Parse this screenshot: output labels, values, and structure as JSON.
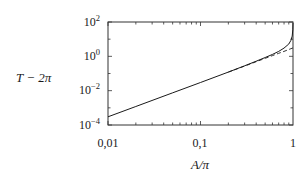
{
  "chart_data": {
    "type": "line",
    "title": "",
    "xlabel": "A/π",
    "ylabel": "T − 2π",
    "xscale": "log",
    "yscale": "log",
    "xlim": [
      0.01,
      1
    ],
    "ylim": [
      0.0001,
      100
    ],
    "x_ticks": [
      {
        "value": 0.01,
        "label": "0,01"
      },
      {
        "value": 0.1,
        "label": "0,1"
      },
      {
        "value": 1,
        "label": "1"
      }
    ],
    "y_ticks": [
      {
        "value": 100,
        "base": "10",
        "exp": "2"
      },
      {
        "value": 1,
        "base": "10",
        "exp": "0"
      },
      {
        "value": 0.01,
        "base": "10",
        "exp": "−2"
      },
      {
        "value": 0.0001,
        "base": "10",
        "exp": "−4"
      }
    ],
    "grid": false,
    "legend": null,
    "series": [
      {
        "name": "exact",
        "style": "solid",
        "color": "#1a1a1a",
        "x": [
          0.01,
          0.02,
          0.05,
          0.1,
          0.2,
          0.3,
          0.4,
          0.5,
          0.6,
          0.7,
          0.8,
          0.9,
          0.95,
          0.98,
          0.995,
          1.0
        ],
        "y": [
          0.0003,
          0.0012,
          0.0075,
          0.03,
          0.12,
          0.28,
          0.52,
          0.85,
          1.3,
          1.95,
          3.0,
          5.2,
          8.5,
          15,
          35,
          90
        ]
      },
      {
        "name": "approximation",
        "style": "dashed",
        "color": "#1a1a1a",
        "x": [
          0.2,
          0.3,
          0.4,
          0.5,
          0.6,
          0.7,
          0.8,
          0.9,
          0.95,
          1.0
        ],
        "y": [
          0.12,
          0.27,
          0.49,
          0.77,
          1.1,
          1.5,
          1.95,
          2.5,
          2.8,
          3.1
        ]
      }
    ]
  }
}
